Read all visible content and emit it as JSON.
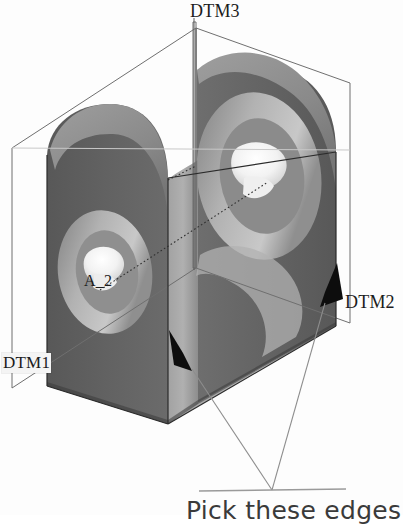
{
  "viewport": {
    "width": 403,
    "height": 515,
    "background": "#fdfdfd"
  },
  "model": {
    "title": "CAD 3D solid model with datum planes",
    "part_type": "U-shaped bracket / clevis with two coaxial through holes"
  },
  "labels": {
    "datum3": "DTM3",
    "datum2": "DTM2",
    "datum1": "DTM1",
    "axis": "A_2",
    "caption": "Pick these edges"
  },
  "colors": {
    "face_dark": "#5d5d5d",
    "face_mid": "#747474",
    "face_light": "#9d9d9d",
    "face_lighter": "#b4b4b4",
    "highlight_white": "#f6f6f6",
    "outline": "#6a6a6a",
    "hidden_line": "#2e2e2e",
    "arrow_fill": "#0d0d0d",
    "leader_line": "#8a8a8a",
    "text": "#1c1c1c",
    "caption_text": "#3a3a3a",
    "background": "#fdfdfd"
  },
  "annotations": {
    "arrows": [
      {
        "name": "edge-arrow-front-bottom",
        "tip_x": 183,
        "tip_y": 353
      },
      {
        "name": "edge-arrow-right-bottom",
        "tip_x": 334,
        "tip_y": 262
      }
    ],
    "leader_convergence": {
      "x": 272,
      "y": 490
    },
    "underline": {
      "x1": 199,
      "y1": 491,
      "x2": 345,
      "y2": 489
    }
  },
  "datum_planes": [
    {
      "id": "DTM1",
      "orientation": "left vertical plane"
    },
    {
      "id": "DTM2",
      "orientation": "right vertical plane"
    },
    {
      "id": "DTM3",
      "orientation": "mid vertical plane through axis"
    }
  ],
  "axes": [
    {
      "id": "A_2",
      "description": "hole axis"
    }
  ]
}
